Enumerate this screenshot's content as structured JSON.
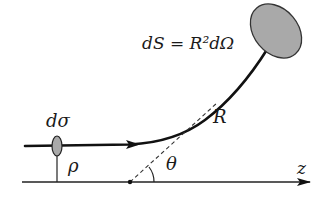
{
  "diagram": {
    "type": "scattering-geometry",
    "labels": {
      "surface_element": "dS = R²dΩ",
      "cross_section": "dσ",
      "impact_parameter": "ρ",
      "scattering_angle": "θ",
      "distance": "R",
      "axis": "z"
    },
    "colors": {
      "line": "#111111",
      "fill": "#a9a9a9",
      "background": "#ffffff"
    },
    "elements": [
      "z-axis with arrow",
      "incoming particle trajectory with arrow",
      "curved scattered trajectory",
      "detector surface dS (gray ellipse)",
      "cross-section element dσ (small gray ellipse)",
      "impact parameter line ρ",
      "dashed asymptote from scattering center",
      "angle arc θ",
      "scattering center dot"
    ]
  }
}
